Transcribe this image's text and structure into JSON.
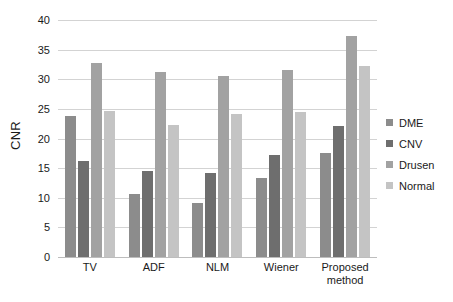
{
  "chart_data": {
    "type": "bar",
    "title": "",
    "xlabel": "",
    "ylabel": "CNR",
    "ylim": [
      0,
      40
    ],
    "yticks": [
      0,
      5,
      10,
      15,
      20,
      25,
      30,
      35,
      40
    ],
    "ytick_labels": [
      "0",
      "5",
      "10",
      "15",
      "20",
      "25",
      "30",
      "35",
      "40"
    ],
    "grid": true,
    "legend_position": "right",
    "categories": [
      "TV",
      "ADF",
      "NLM",
      "Wiener",
      "Proposed method"
    ],
    "series": [
      {
        "name": "DME",
        "color": "#8c8c8c",
        "values": [
          23.8,
          10.7,
          9.2,
          13.4,
          17.5
        ]
      },
      {
        "name": "CNV",
        "color": "#6e6e6e",
        "values": [
          16.2,
          14.5,
          14.2,
          17.2,
          22.1
        ]
      },
      {
        "name": "Drusen",
        "color": "#a2a2a2",
        "values": [
          32.8,
          31.3,
          30.5,
          31.5,
          37.3
        ]
      },
      {
        "name": "Normal",
        "color": "#c4c4c4",
        "values": [
          24.7,
          22.2,
          24.1,
          24.4,
          32.3
        ]
      }
    ]
  }
}
